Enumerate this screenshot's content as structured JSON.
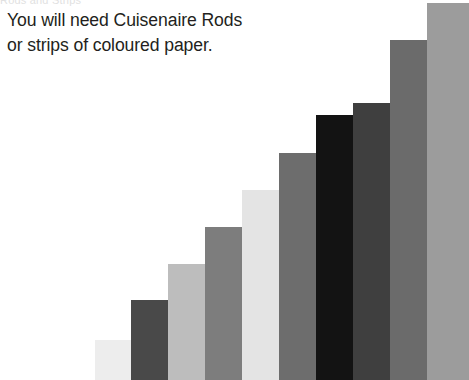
{
  "page": {
    "background_color": "#ffffff",
    "width": 469,
    "height": 380
  },
  "clipped_header": {
    "text": "Rods and Strips"
  },
  "instruction": {
    "line1": "You will need Cuisenaire Rods",
    "line2": "or strips of coloured paper.",
    "color": "#231f20"
  },
  "chart_data": {
    "type": "bar",
    "title": "",
    "subtitle": "",
    "xlabel": "",
    "ylabel": "",
    "grid": false,
    "legend": false,
    "orientation": "vertical",
    "categories": [
      "1",
      "2",
      "3",
      "4",
      "5",
      "6",
      "7",
      "8",
      "9",
      "10"
    ],
    "values": [
      40,
      80,
      116,
      153,
      190,
      227,
      265,
      277,
      340,
      377
    ],
    "ylim": [
      0,
      380
    ],
    "bar_width": 37,
    "bar_gap": 0,
    "x_start": 95,
    "baseline_y": 380,
    "colors": [
      "#ededed",
      "#494949",
      "#bdbdbd",
      "#7d7d7d",
      "#e4e4e4",
      "#6d6d6d",
      "#131313",
      "#3f3f3f",
      "#6b6b6b",
      "#9c9c9c"
    ],
    "bars": [
      {
        "index": 1,
        "label": "rod-1",
        "value": 40,
        "top": 340,
        "left": 95,
        "width": 36,
        "color": "#ededed"
      },
      {
        "index": 2,
        "label": "rod-2",
        "value": 80,
        "top": 300,
        "left": 131,
        "width": 37,
        "color": "#494949"
      },
      {
        "index": 3,
        "label": "rod-3",
        "value": 116,
        "top": 264,
        "left": 168,
        "width": 37,
        "color": "#bdbdbd"
      },
      {
        "index": 4,
        "label": "rod-4",
        "value": 153,
        "top": 227,
        "left": 205,
        "width": 37,
        "color": "#7d7d7d"
      },
      {
        "index": 5,
        "label": "rod-5",
        "value": 190,
        "top": 190,
        "left": 242,
        "width": 37,
        "color": "#e4e4e4"
      },
      {
        "index": 6,
        "label": "rod-6",
        "value": 227,
        "top": 153,
        "left": 279,
        "width": 37,
        "color": "#6d6d6d"
      },
      {
        "index": 7,
        "label": "rod-7",
        "value": 265,
        "top": 115,
        "left": 316,
        "width": 37,
        "color": "#131313"
      },
      {
        "index": 8,
        "label": "rod-8",
        "value": 277,
        "top": 103,
        "left": 353,
        "width": 37,
        "color": "#3f3f3f"
      },
      {
        "index": 9,
        "label": "rod-9",
        "value": 340,
        "top": 40,
        "left": 390,
        "width": 37,
        "color": "#6b6b6b"
      },
      {
        "index": 10,
        "label": "rod-10",
        "value": 377,
        "top": 3,
        "left": 427,
        "width": 42,
        "color": "#9c9c9c"
      }
    ]
  }
}
